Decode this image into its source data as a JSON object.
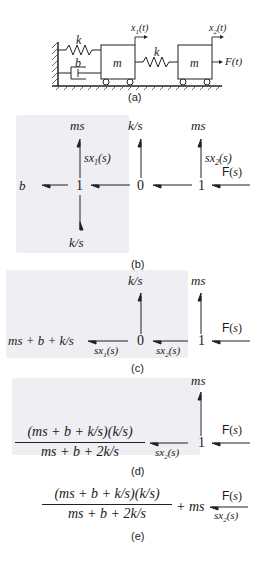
{
  "panel_a": {
    "caption": "(a)",
    "spring_top": "k",
    "damper": "b",
    "mass1": "m",
    "spring_mid": "k",
    "mass2": "m",
    "x1": "x1(t)",
    "x2": "x2(t)",
    "force": "F(t)"
  },
  "panel_b": {
    "caption": "(b)",
    "node1": "1",
    "node0": "0",
    "node2": "1",
    "ms_top_left": "ms",
    "ks_top": "k/s",
    "ms_top_right": "ms",
    "b_left": "b",
    "ks_bottom": "k/s",
    "flow1": "sx1(s)",
    "flow2": "sx2(s)",
    "force": "F(s)"
  },
  "panel_c": {
    "caption": "(c)",
    "combined": "ms + b + k/s",
    "node0": "0",
    "node1": "1",
    "ks_top": "k/s",
    "ms_top": "ms",
    "flow1": "sx1(s)",
    "flow2": "sx2(s)",
    "force": "F(s)"
  },
  "panel_d": {
    "caption": "(d)",
    "numerator": "(ms + b + k/s)(k/s)",
    "denominator": "ms + b + 2k/s",
    "node1": "1",
    "ms_top": "ms",
    "flow2": "sx2(s)",
    "force": "F(s)"
  },
  "panel_e": {
    "caption": "(e)",
    "numerator": "(ms + b + k/s)(k/s)",
    "denominator": "ms + b + 2k/s",
    "plus_term": "+ ms",
    "force": "F(s)",
    "flow2": "sx2(s)"
  },
  "colors": {
    "shade": "#eeeef3",
    "ink": "#1a1a1a"
  }
}
